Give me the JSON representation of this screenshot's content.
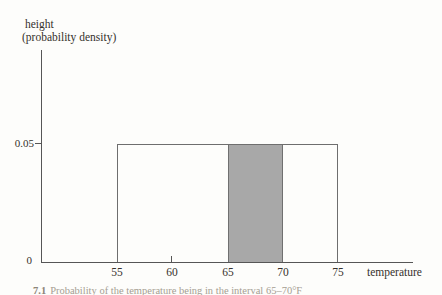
{
  "figure": {
    "y_axis_title_line1": "height",
    "y_axis_title_line2": "(probability density)",
    "y_tick_label_005": "0.05",
    "y_tick_label_0": "0",
    "x_tick_labels": [
      "55",
      "60",
      "65",
      "70",
      "75"
    ],
    "x_axis_label": "temperature",
    "caption_number": "7.1",
    "caption_text": "Probability of the temperature being in the interval 65–70°F"
  },
  "chart_data": {
    "type": "area",
    "subtype": "uniform-probability-density-function",
    "title": "",
    "xlabel": "temperature",
    "ylabel": "height (probability density)",
    "x_ticks": [
      55,
      60,
      65,
      70,
      75
    ],
    "y_ticks": [
      0,
      0.05
    ],
    "xlim": [
      48,
      82
    ],
    "ylim": [
      0,
      0.075
    ],
    "grid": false,
    "legend": "none",
    "series": [
      {
        "name": "uniform density over [55, 75]",
        "x": [
          55,
          75
        ],
        "y": [
          0.05,
          0.05
        ],
        "fill": "white",
        "outline": "#6e6e6e"
      }
    ],
    "shaded_interval": {
      "x_start": 65,
      "x_end": 70,
      "height": 0.05,
      "fill": "#a8a8a8"
    },
    "caption": "7.1 Probability of the temperature being in the interval 65–70°F"
  },
  "colors": {
    "background": "#fdfdfb",
    "axis_line": "#565656",
    "box_border": "#6e6e6e",
    "shade_fill": "#a8a8a8",
    "shade_edge": "#707070",
    "text": "#35312b",
    "caption_text": "#a59d92"
  }
}
